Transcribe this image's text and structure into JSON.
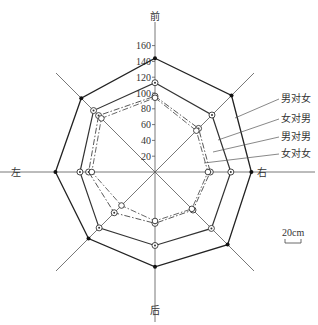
{
  "chart_data": {
    "type": "radar",
    "title": "",
    "axes": [
      "前",
      "右前",
      "右",
      "右后",
      "后",
      "左后",
      "左",
      "左前"
    ],
    "axis_labels": {
      "front": "前",
      "right": "右",
      "back": "后",
      "left": "左"
    },
    "radial_ticks": [
      20,
      40,
      60,
      80,
      100,
      120,
      140,
      160
    ],
    "rlim": [
      0,
      160
    ],
    "series": [
      {
        "name": "男对女",
        "style": "solid",
        "marker": "filled-dot",
        "values": [
          144,
          137,
          122,
          130,
          120,
          119,
          126,
          132
        ]
      },
      {
        "name": "女对男",
        "style": "solid",
        "marker": "circle-dot",
        "values": [
          113,
          102,
          96,
          101,
          93,
          100,
          95,
          110
        ]
      },
      {
        "name": "男对男",
        "style": "dash-dot",
        "marker": "circle-dot",
        "values": [
          96,
          78,
          70,
          68,
          65,
          73,
          84,
          101
        ]
      },
      {
        "name": "女对女",
        "style": "dash-dot",
        "marker": "open-circle",
        "values": [
          94,
          74,
          67,
          66,
          62,
          60,
          80,
          96
        ]
      }
    ],
    "scale_bar": "20cm",
    "legend_position": "right"
  }
}
